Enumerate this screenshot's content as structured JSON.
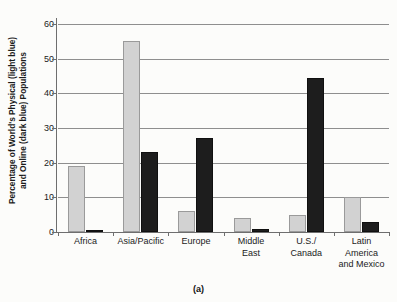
{
  "chart_data": {
    "type": "bar",
    "title": "",
    "categories": [
      "Africa",
      "Asia/Pacific",
      "Europe",
      "Middle East",
      "U.S./Canada",
      "Latin America and Mexico"
    ],
    "category_lines": [
      [
        "Africa"
      ],
      [
        "Asia/Pacific"
      ],
      [
        "Europe"
      ],
      [
        "Middle",
        "East"
      ],
      [
        "U.S./",
        "Canada"
      ],
      [
        "Latin",
        "America",
        "and Mexico"
      ]
    ],
    "series": [
      {
        "name": "Physical (light blue)",
        "color": "#d2d2d2",
        "values": [
          19,
          55,
          6,
          4,
          5,
          10
        ]
      },
      {
        "name": "Online (dark blue)",
        "color": "#1d1d1d",
        "values": [
          0.5,
          23,
          27,
          0.8,
          44.5,
          3
        ]
      }
    ],
    "xlabel": "",
    "ylabel": "Percentage of World's Physical (light blue) and Online (dark blue) Populations",
    "ylabel_line1": "Percentage of World's Physical (light blue)",
    "ylabel_line2": "and Online (dark blue) Populations",
    "ylim": [
      0,
      60
    ],
    "yticks": [
      0,
      10,
      20,
      30,
      40,
      50,
      60
    ],
    "ytick_labels": [
      "0",
      "10",
      "20",
      "30",
      "40",
      "50",
      "60"
    ],
    "grid": true,
    "legend": "none"
  },
  "caption": "(a)"
}
